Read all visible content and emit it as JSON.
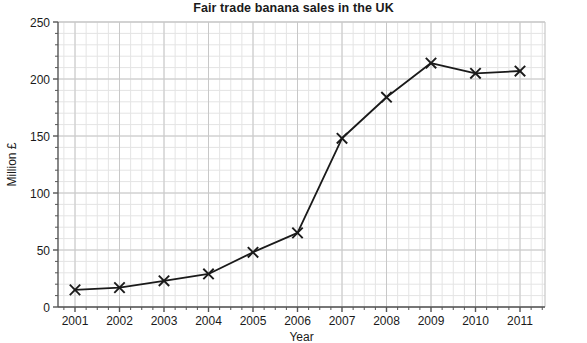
{
  "chart_data": {
    "type": "line",
    "title": "Fair trade banana sales in the UK",
    "xlabel": "Year",
    "ylabel": "Million £",
    "categories": [
      "2001",
      "2002",
      "2003",
      "2004",
      "2005",
      "2006",
      "2007",
      "2008",
      "2009",
      "2010",
      "2011"
    ],
    "values": [
      15,
      17,
      23,
      29,
      48,
      65,
      148,
      184,
      214,
      205,
      207
    ],
    "series": [
      {
        "name": "Fair trade banana sales",
        "values": [
          15,
          17,
          23,
          29,
          48,
          65,
          148,
          184,
          214,
          205,
          207
        ]
      }
    ],
    "xlim": [
      2001,
      2011
    ],
    "ylim": [
      0,
      250
    ],
    "ytick_labels": [
      "0",
      "50",
      "100",
      "150",
      "200",
      "250"
    ],
    "ytick_values": [
      0,
      50,
      100,
      150,
      200,
      250
    ],
    "xtick_labels": [
      "2001",
      "2002",
      "2003",
      "2004",
      "2005",
      "2006",
      "2007",
      "2008",
      "2009",
      "2010",
      "2011"
    ],
    "grid": true,
    "grid_minor": true,
    "legend": "none",
    "marker": "x-cross",
    "line_color": "#1a1a1a",
    "marker_color": "#1a1a1a",
    "grid_color": "#c8c8c8",
    "grid_minor_color": "#e4e4e4",
    "axis_color": "#555555",
    "background_color": "#ffffff"
  }
}
